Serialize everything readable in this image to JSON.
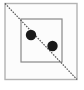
{
  "figure": {
    "title": "Square with inscribed square, diagonal and two dots",
    "canvas": {
      "width": 84,
      "height": 90,
      "background_color": "#ffffff"
    },
    "outer_square": {
      "label": "outer square",
      "x": 5,
      "y": 3.5,
      "width": 72,
      "height": 76,
      "stroke_color": "#b3b3b3",
      "stroke_width": 1.4,
      "fill_color": "#fcfcfc"
    },
    "inner_square": {
      "label": "inner square",
      "x": 21,
      "y": 19,
      "width": 41,
      "height": 43,
      "stroke_color": "#888888",
      "stroke_width": 1.2,
      "fill_color": "none"
    },
    "diagonal": {
      "label": "diagonal line",
      "x1": 5,
      "y1": 3.5,
      "x2": 77,
      "y2": 79.5,
      "stroke_color": "#555555",
      "stroke_width": 1.2,
      "dash_pattern": "1.6 1.2"
    },
    "dots": [
      {
        "label": "upper-left dot",
        "cx": 31,
        "cy": 35,
        "r": 5.2,
        "fill_color": "#1a1a1a"
      },
      {
        "label": "lower-right dot",
        "cx": 52.5,
        "cy": 46,
        "r": 5.2,
        "fill_color": "#1a1a1a"
      }
    ]
  }
}
